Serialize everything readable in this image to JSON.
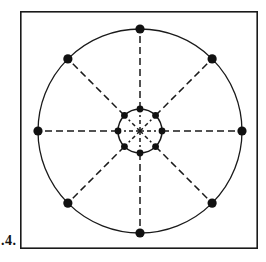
{
  "figure": {
    "caption": ".4.",
    "frame": {
      "x": 20,
      "y": 11,
      "width": 238,
      "height": 238,
      "stroke_color": "#1a1a1a",
      "stroke_width": 1.6,
      "fill_color": "#ffffff"
    },
    "center": {
      "x": 140,
      "y": 131
    },
    "outer_circle": {
      "radius": 102,
      "stroke_color": "#1a1a1a",
      "stroke_width": 1.3,
      "dot_radius": 4.6,
      "dot_color": "#111111",
      "dot_count": 8,
      "dot_angles_deg": [
        270,
        315,
        0,
        45,
        90,
        135,
        180,
        225
      ],
      "dot_labels": [
        "N",
        "NE",
        "E",
        "SE",
        "S",
        "SW",
        "W",
        "NW"
      ]
    },
    "inner_circle": {
      "radius": 22,
      "stroke_color": "#1a1a1a",
      "stroke_width": 1.5,
      "dot_radius": 3.4,
      "dot_color": "#111111",
      "dot_count": 8,
      "dot_angles_deg": [
        270,
        315,
        0,
        45,
        90,
        135,
        180,
        225
      ],
      "dot_labels": [
        "N",
        "NE",
        "E",
        "SE",
        "S",
        "SW",
        "W",
        "NW"
      ]
    },
    "spokes": {
      "count": 8,
      "angles_deg": [
        270,
        315,
        0,
        45,
        90,
        135,
        180,
        225
      ],
      "stroke_color": "#1a1a1a",
      "stroke_width": 1.5,
      "dash_pattern": "7 4",
      "inner_stub_length": 16,
      "note": "dashed radial lines from center through inner ring dots out to outer ring dots"
    },
    "background_color": "#ffffff"
  }
}
